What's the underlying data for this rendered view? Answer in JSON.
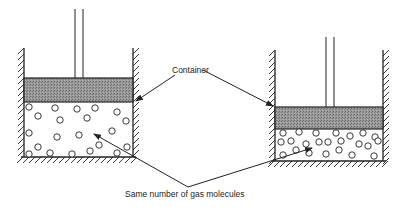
{
  "diagram": {
    "labels": {
      "container": "Container",
      "molecules": "Same number of gas molecules"
    },
    "colors": {
      "line": "#222222",
      "piston_fill": "#8a8a8a",
      "background": "#ffffff"
    },
    "left_cylinder": {
      "wall_left_x": 24,
      "wall_right_x": 133,
      "wall_top_y": 48,
      "floor_y": 157,
      "piston_top_y": 78,
      "piston_bottom_y": 102,
      "rod_x": [
        75,
        83
      ],
      "rod_top_y": 9,
      "molecules": [
        [
          29,
          107
        ],
        [
          55,
          108
        ],
        [
          77,
          109
        ],
        [
          95,
          108
        ],
        [
          117,
          112
        ],
        [
          38,
          116
        ],
        [
          60,
          120
        ],
        [
          87,
          118
        ],
        [
          126,
          121
        ],
        [
          29,
          133
        ],
        [
          57,
          137
        ],
        [
          79,
          135
        ],
        [
          112,
          131
        ],
        [
          38,
          147
        ],
        [
          99,
          145
        ],
        [
          127,
          147
        ],
        [
          29,
          154
        ],
        [
          50,
          153
        ],
        [
          72,
          154
        ],
        [
          90,
          151
        ],
        [
          117,
          153
        ]
      ]
    },
    "right_cylinder": {
      "wall_left_x": 275,
      "wall_right_x": 383,
      "wall_top_y": 50,
      "floor_y": 161,
      "piston_top_y": 107,
      "piston_bottom_y": 129,
      "rod_x": [
        326,
        334
      ],
      "rod_top_y": 37,
      "molecules": [
        [
          283,
          133
        ],
        [
          299,
          132
        ],
        [
          316,
          133
        ],
        [
          336,
          133
        ],
        [
          350,
          136
        ],
        [
          363,
          133
        ],
        [
          375,
          137
        ],
        [
          281,
          142
        ],
        [
          291,
          141
        ],
        [
          306,
          144
        ],
        [
          319,
          142
        ],
        [
          328,
          142
        ],
        [
          341,
          141
        ],
        [
          359,
          144
        ],
        [
          368,
          146
        ],
        [
          378,
          141
        ],
        [
          283,
          155
        ],
        [
          296,
          150
        ],
        [
          309,
          153
        ],
        [
          326,
          154
        ],
        [
          339,
          150
        ],
        [
          352,
          155
        ],
        [
          374,
          156
        ]
      ]
    },
    "arrows": {
      "container_left": {
        "from": [
          175,
          75
        ],
        "to": [
          136,
          101
        ]
      },
      "container_right": {
        "from": [
          203,
          70
        ],
        "to": [
          273,
          106
        ]
      },
      "molecules_left": {
        "from": [
          188,
          187
        ],
        "to": [
          94,
          134
        ]
      },
      "molecules_right": {
        "from": [
          188,
          187
        ],
        "to": [
          312,
          148
        ]
      }
    }
  }
}
